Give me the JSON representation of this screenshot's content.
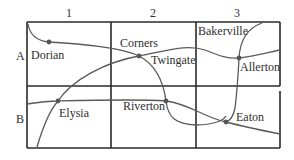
{
  "map": {
    "columns": [
      {
        "label": "1"
      },
      {
        "label": "2"
      },
      {
        "label": "3"
      }
    ],
    "rows": [
      {
        "label": "A"
      },
      {
        "label": "B"
      }
    ],
    "towns": [
      {
        "name": "Dorian",
        "cell": "A1"
      },
      {
        "name": "Corners",
        "cell": "A2"
      },
      {
        "name": "Twingate",
        "cell": "A2"
      },
      {
        "name": "Bakerville",
        "cell": "A3"
      },
      {
        "name": "Allerton",
        "cell": "A3"
      },
      {
        "name": "Elysia",
        "cell": "B1"
      },
      {
        "name": "Riverton",
        "cell": "B2"
      },
      {
        "name": "Eaton",
        "cell": "B3"
      }
    ],
    "colors": {
      "grid": "#2a2a2a",
      "road": "#555555",
      "dot": "#555555"
    }
  }
}
